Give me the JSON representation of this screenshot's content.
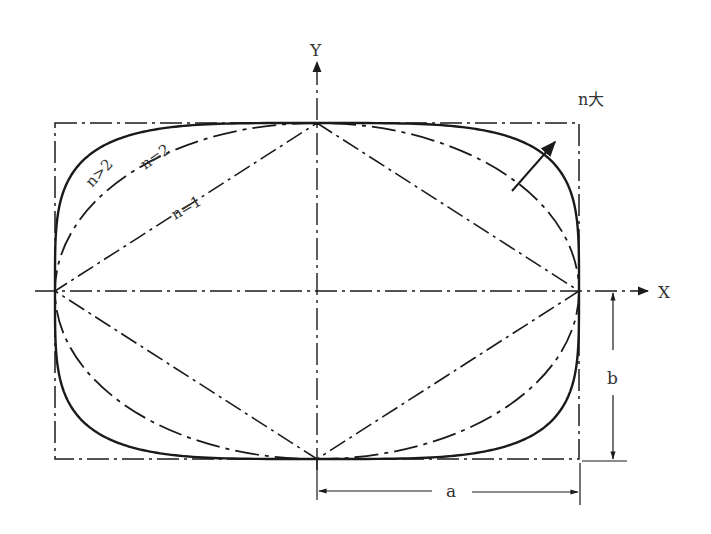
{
  "diagram": {
    "type": "superellipse",
    "equation": "|x/a|^n + |y/b|^n = 1",
    "axes": {
      "x_label": "X",
      "y_label": "Y"
    },
    "curves": [
      {
        "name": "n=1",
        "n": 1,
        "label": "n=1",
        "style": "dash-dot"
      },
      {
        "name": "n=2",
        "n": 2,
        "label": "n=2",
        "style": "long-dash-dot"
      },
      {
        "name": "n>2",
        "n": 4,
        "label": "n>2",
        "style": "solid"
      }
    ],
    "annotations": {
      "n_increase": "n大",
      "dim_a": "a",
      "dim_b": "b"
    },
    "colors": {
      "line": "#1a1a1a",
      "text": "#333333",
      "background": "#ffffff"
    }
  }
}
